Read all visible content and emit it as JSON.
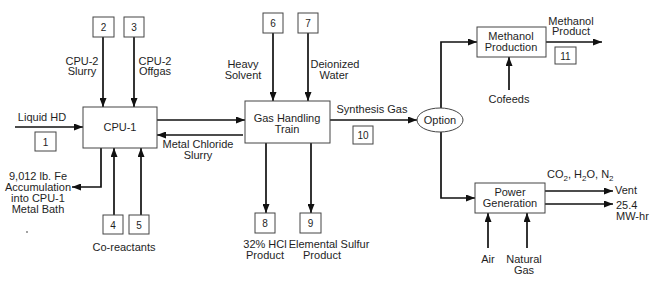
{
  "colors": {
    "background": "#ffffff",
    "line": "#111111",
    "box_border": "#444444",
    "text": "#1e1e1e"
  },
  "units": {
    "cpu1": {
      "lines": [
        "CPU-1"
      ]
    },
    "gas_handling": {
      "lines": [
        "Gas Handling",
        "Train"
      ]
    },
    "option": {
      "lines": [
        "Option"
      ]
    },
    "methanol_production": {
      "lines": [
        "Methanol",
        "Production"
      ]
    },
    "power_generation": {
      "lines": [
        "Power",
        "Generation"
      ]
    }
  },
  "streams": {
    "s1": {
      "number": "1",
      "label": [
        "Liquid HD"
      ]
    },
    "s2": {
      "number": "2",
      "label": [
        "CPU-2",
        "Slurry"
      ]
    },
    "s3": {
      "number": "3",
      "label": [
        "CPU-2",
        "Offgas"
      ]
    },
    "s4": {
      "number": "4"
    },
    "s5": {
      "number": "5"
    },
    "co_reactants": {
      "label": [
        "Co-reactants"
      ]
    },
    "s6": {
      "number": "6",
      "label": [
        "Heavy",
        "Solvent"
      ]
    },
    "s7": {
      "number": "7",
      "label": [
        "Deionized",
        "Water"
      ]
    },
    "s8": {
      "number": "8",
      "label": [
        "32% HCl",
        "Product"
      ]
    },
    "s9": {
      "number": "9",
      "label": [
        "Elemental Sulfur",
        "Product"
      ]
    },
    "s10": {
      "number": "10",
      "label": [
        "Synthesis Gas"
      ]
    },
    "s11": {
      "number": "11",
      "label": [
        "Methanol",
        "Product"
      ]
    }
  },
  "other_streams": {
    "metal_chloride": {
      "label": [
        "Metal Chloride",
        "Slurry"
      ]
    },
    "fe_accumulation": {
      "label": [
        "9,012 lb. Fe",
        "Accumulation",
        "into CPU-1",
        "Metal Bath"
      ]
    },
    "cofeeds": {
      "label": [
        "Cofeeds"
      ]
    },
    "air": {
      "label": [
        "Air"
      ]
    },
    "natural_gas": {
      "label": [
        "Natural",
        "Gas"
      ]
    },
    "vent": {
      "label": "Vent",
      "composition": "CO2, H2O, N2",
      "composition_parts": [
        "CO",
        "2",
        ", H",
        "2",
        "O, N",
        "2"
      ]
    },
    "power_output": {
      "label": [
        "25.4",
        "MW-hr"
      ]
    }
  }
}
